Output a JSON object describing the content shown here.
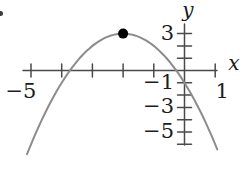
{
  "figure": {
    "background": "#ffffff",
    "axis_color": "#4a4a4a",
    "curve_color": "#8c8c8c",
    "point_color": "#000000",
    "label_color": "#1c1c1c",
    "marker_dot_color": "#3a3a3a"
  },
  "chart_data": {
    "type": "line",
    "title": "",
    "function": {
      "a": -1,
      "b": -4,
      "c": -1,
      "formula": "y = -x^2 - 4x - 1"
    },
    "x_domain": [
      -5.13,
      1.07
    ],
    "marked_point": {
      "x": -2,
      "y": 3
    },
    "key_points": {
      "vertex": [
        -2,
        3
      ],
      "y_intercept": [
        0,
        -1
      ],
      "x_intercepts": [
        -3.73,
        -0.27
      ]
    },
    "x_axis": {
      "label": "x",
      "range": [
        -5.3,
        1.3
      ],
      "ticks": [
        -5,
        -4,
        -3,
        -2,
        -1,
        1
      ],
      "labeled_ticks": [
        {
          "v": -5,
          "text": "−5"
        },
        {
          "v": 1,
          "text": "1"
        }
      ]
    },
    "y_axis": {
      "label": "y",
      "range": [
        -6.6,
        3.8
      ],
      "ticks": [
        3,
        2,
        1,
        -1,
        -2,
        -3,
        -4,
        -5,
        -6
      ],
      "labeled_ticks": [
        {
          "v": 3,
          "text": "3"
        },
        {
          "v": -1,
          "text": "−1"
        },
        {
          "v": -3,
          "text": "−3"
        },
        {
          "v": -5,
          "text": "−5"
        }
      ]
    },
    "grid": false,
    "legend": false
  }
}
